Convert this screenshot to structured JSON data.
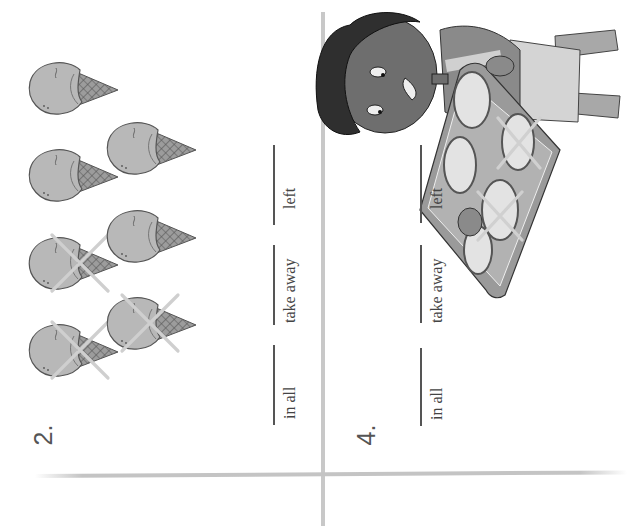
{
  "page": {
    "orientation": "rotated-90-ccw",
    "background": "#ffffff",
    "divider_color": "#c4c4c4"
  },
  "problems": [
    {
      "number": "2.",
      "picture": "ice-cream-cones",
      "total_items": 7,
      "crossed_out": 3,
      "blanks": [
        {
          "label": "in all",
          "value": ""
        },
        {
          "label": "take away",
          "value": ""
        },
        {
          "label": "left",
          "value": ""
        }
      ]
    },
    {
      "number": "4.",
      "picture": "child-holding-tray-of-pizzas",
      "total_items": 5,
      "crossed_out": 2,
      "blanks": [
        {
          "label": "in all",
          "value": ""
        },
        {
          "label": "take away",
          "value": ""
        },
        {
          "label": "left",
          "value": ""
        }
      ]
    }
  ],
  "colors": {
    "scoop": "#b8b8b8",
    "cone": "#8a8a8a",
    "cross": "#c9c9c9",
    "skin": "#6e6e6e",
    "hair": "#2f2f2f",
    "tray": "#9a9a9a",
    "pizza": "#e3e3e3"
  }
}
